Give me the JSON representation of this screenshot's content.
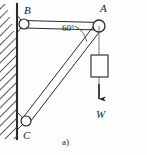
{
  "figure": {
    "caption": "a)"
  },
  "labels": {
    "joint_b": "B",
    "joint_a": "A",
    "joint_c": "C",
    "weight": "W",
    "angle": "60°"
  },
  "geometry": {
    "wall_x": 17,
    "wall_top": 4,
    "wall_bottom": 139,
    "joint_b": {
      "x": 24,
      "y": 24,
      "r": 5
    },
    "joint_a": {
      "x": 99,
      "y": 26,
      "r": 6
    },
    "joint_c": {
      "x": 26,
      "y": 121,
      "r": 5
    },
    "rope_top": {
      "x": 99,
      "y": 26
    },
    "rope_bottom": {
      "x": 99,
      "y": 104
    },
    "weight_box": {
      "x": 91,
      "y": 55,
      "w": 17,
      "h": 22
    },
    "arrow_tip": {
      "x": 99,
      "y": 105
    },
    "angle_arc_radius": 24
  },
  "colors": {
    "ink": "#1a1a1a",
    "line": "#2b2b2b",
    "hatch": "#5a5a5a",
    "background": "#fefefe"
  }
}
